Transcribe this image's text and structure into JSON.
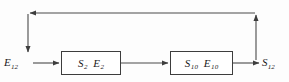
{
  "diagram": {
    "type": "block-flow-diagram",
    "background_color": "#fdfdfd",
    "line_color": "#4a4a4a",
    "text_color": "#1a1a1a",
    "nodes": {
      "input": {
        "symbol": "E",
        "subscript": "12",
        "full": "E12"
      },
      "output": {
        "symbol": "S",
        "subscript": "12",
        "full": "S12"
      }
    },
    "blocks": [
      {
        "id": "stage-1",
        "left_symbol": "S",
        "left_subscript": "2",
        "right_symbol": "E",
        "right_subscript": "2",
        "full": "S2 E2"
      },
      {
        "id": "stage-2",
        "left_symbol": "S",
        "left_subscript": "10",
        "right_symbol": "E",
        "right_subscript": "10",
        "full": "S10 E10"
      }
    ],
    "connections": [
      {
        "name": "input-to-stage-1",
        "direction": "right",
        "arrowhead": true
      },
      {
        "name": "stage-1-to-stage-2",
        "direction": "right",
        "arrowhead": true
      },
      {
        "name": "stage-2-to-output",
        "direction": "right",
        "arrowhead": true
      },
      {
        "name": "feedback-riser-right",
        "direction": "up",
        "arrowhead": true
      },
      {
        "name": "feedback-top-line",
        "direction": "left",
        "arrowhead": true
      },
      {
        "name": "feedback-drop-left",
        "direction": "down",
        "arrowhead": true
      }
    ]
  }
}
